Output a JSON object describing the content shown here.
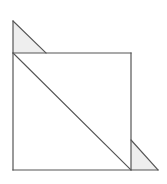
{
  "figure": {
    "title": "",
    "width": 167,
    "height": 184,
    "background_color": "#ffffff",
    "stroke_color": "#555555",
    "stroke_width": 1.2,
    "shade_fill": "#eeeeee",
    "white_fill": "#ffffff",
    "shapes": [
      {
        "name": "top-left-shaded-triangle",
        "type": "polygon",
        "fill": "#eeeeee",
        "stroke": "#555555",
        "points": "13,21 13,53 46,53"
      },
      {
        "name": "bottom-right-shaded-triangle",
        "type": "polygon",
        "fill": "#eeeeee",
        "stroke": "#555555",
        "points": "131,140 131,170 158,170"
      },
      {
        "name": "main-white-region",
        "type": "polygon",
        "fill": "#ffffff",
        "stroke": "#555555",
        "points": "13,53 131,53 131,170 13,170"
      }
    ],
    "lines": [
      {
        "name": "left-vertical-edge",
        "x1": 13,
        "y1": 21,
        "x2": 13,
        "y2": 170
      },
      {
        "name": "bottom-horizontal-edge",
        "x1": 13,
        "y1": 170,
        "x2": 158,
        "y2": 170
      },
      {
        "name": "top-horizontal-edge",
        "x1": 13,
        "y1": 53,
        "x2": 131,
        "y2": 53
      },
      {
        "name": "right-vertical-edge",
        "x1": 131,
        "y1": 53,
        "x2": 131,
        "y2": 170
      },
      {
        "name": "main-diagonal",
        "x1": 13,
        "y1": 53,
        "x2": 131,
        "y2": 170
      },
      {
        "name": "top-left-triangle-hypotenuse",
        "x1": 13,
        "y1": 21,
        "x2": 46,
        "y2": 53
      },
      {
        "name": "bottom-right-triangle-hypotenuse",
        "x1": 131,
        "y1": 140,
        "x2": 158,
        "y2": 170
      }
    ]
  }
}
